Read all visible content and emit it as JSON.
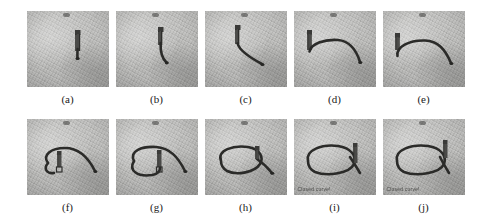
{
  "figure": {
    "type": "image-sequence-figure",
    "layout": {
      "rows": 2,
      "columns": 5,
      "total_panels": 10
    },
    "panels": [
      {
        "id": "a",
        "caption": "(a)",
        "row": 1,
        "column": 1,
        "description": "Gripper holding a short vertical rope end on a textured table surface; no curve traced yet.",
        "overlay_text": ""
      },
      {
        "id": "b",
        "caption": "(b)",
        "row": 1,
        "column": 2,
        "description": "Gripper has pulled the rope downward forming a short hanging tail.",
        "overlay_text": ""
      },
      {
        "id": "c",
        "caption": "(c)",
        "row": 1,
        "column": 3,
        "description": "Rope laid out diagonally to the lower right; gripper at the upper bend.",
        "overlay_text": ""
      },
      {
        "id": "d",
        "caption": "(d)",
        "row": 1,
        "column": 4,
        "description": "Rope forms a long arch from the gripper on the left across to the lower right.",
        "overlay_text": ""
      },
      {
        "id": "e",
        "caption": "(e)",
        "row": 1,
        "column": 5,
        "description": "Gripper released at the left; rope keeps the wide arch shape.",
        "overlay_text": ""
      },
      {
        "id": "f",
        "caption": "(f)",
        "row": 2,
        "column": 1,
        "description": "Left end of the rope curled back forming an open hook; gripper repositioned inside the loop.",
        "overlay_text": ""
      },
      {
        "id": "g",
        "caption": "(g)",
        "row": 2,
        "column": 2,
        "description": "Loop is nearly closed on the left side; free tail still extends to the right.",
        "overlay_text": ""
      },
      {
        "id": "h",
        "caption": "(h)",
        "row": 2,
        "column": 3,
        "description": "Loop closed into an oval; gripper moved to the right crossing point.",
        "overlay_text": ""
      },
      {
        "id": "i",
        "caption": "(i)",
        "row": 2,
        "column": 4,
        "description": "Rope ends cross on the right forming a closed loop; detection message displayed.",
        "overlay_text": "Closed curve!"
      },
      {
        "id": "j",
        "caption": "(j)",
        "row": 2,
        "column": 5,
        "description": "Final closed curve with gripper lifted away; detection message displayed.",
        "overlay_text": "Closed curve!"
      }
    ]
  },
  "colors": {
    "background": "#ffffff",
    "surface_light": "#c6c6c4",
    "surface_dark": "#a8a8a6",
    "rope": "#2b2b29",
    "gripper": "#3a3a38",
    "caption_text": "#1a1a1a",
    "overlay_text": "#3a3a38"
  }
}
